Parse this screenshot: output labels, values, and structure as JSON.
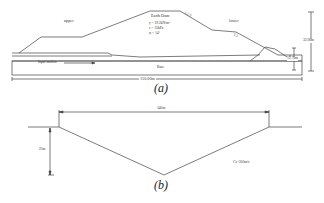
{
  "panel_a": {
    "caption": "(a)",
    "region_upper": "upper",
    "region_lower": "lower",
    "dam_title": "Earth Dam",
    "dam_params": [
      "γ = 19.2kN/m³",
      "c = 35kPa",
      "φ = 14°"
    ],
    "slope_upper": "1:2.5",
    "slope_lower": "1:3",
    "input_motion": "Input motion",
    "base": "Base",
    "width_dim": "150.00m",
    "height_total": "32.00m",
    "height_base": "12.70m"
  },
  "panel_b": {
    "caption": "(b)",
    "width_dim": "340m",
    "depth_dim": "25m",
    "velocity": "Cs=300m/s"
  }
}
